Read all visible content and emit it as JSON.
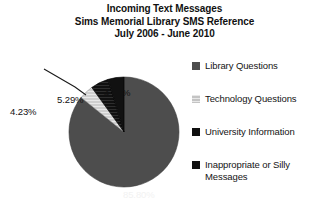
{
  "title": {
    "line1": "Incoming Text Messages",
    "line2": "Sims Memorial Library SMS Reference",
    "line3": "July 2006 - June 2010"
  },
  "legend": {
    "items": [
      {
        "label": "Library Questions",
        "color": "#4d4d4d",
        "pattern": "solid"
      },
      {
        "label": "Technology Questions",
        "color": "#c9c9c9",
        "pattern": "light"
      },
      {
        "label": "University Information",
        "color": "#0f0f0f",
        "pattern": "solid"
      },
      {
        "label": "Inappropriate or Silly Messages",
        "color": "#111111",
        "pattern": "solid"
      }
    ]
  },
  "labels": {
    "p_library": "85.80%",
    "p_technology": "4.23%",
    "p_university": "5.29%",
    "p_inappropriate": "4.68%"
  },
  "chart_data": {
    "type": "pie",
    "categories": [
      "Library Questions",
      "Technology Questions",
      "University Information",
      "Inappropriate or Silly Messages"
    ],
    "values": [
      85.8,
      4.23,
      5.29,
      4.68
    ],
    "value_labels": [
      "85.80%",
      "4.23%",
      "5.29%",
      "4.68%"
    ],
    "colors": [
      "#4d4d4d",
      "#c9c9c9",
      "#0f0f0f",
      "#111111"
    ],
    "units": "percent",
    "start_angle_deg": 0,
    "direction": "clockwise",
    "legend_position": "right",
    "grid": false,
    "xlabel": "",
    "ylabel": ""
  }
}
